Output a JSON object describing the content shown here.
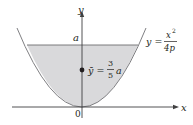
{
  "diagram": {
    "type": "parabolic-region-centroid",
    "axes": {
      "x_label": "x",
      "y_label": "y",
      "origin_label": "0"
    },
    "level_label": "a",
    "curve": {
      "label_lhs": "y =",
      "label_num": "x",
      "label_num_exp": "2",
      "label_den": "4p"
    },
    "centroid": {
      "label_lhs": "ȳ =",
      "label_num": "3",
      "label_den": "5",
      "label_rhs": "a"
    },
    "colors": {
      "fill": "#d9d9db",
      "stroke": "#808083",
      "axis": "#404041",
      "text": "#231f20",
      "dot": "#231f20"
    }
  }
}
